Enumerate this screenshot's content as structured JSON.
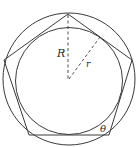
{
  "diagram": {
    "type": "geometry",
    "labels": {
      "circumradius": "R",
      "inradius": "r",
      "angle": "θ"
    },
    "colors": {
      "stroke": "#3a3a3a",
      "background": "#ffffff"
    },
    "geometry": {
      "center": [
        69,
        79
      ],
      "circumradius_px": 66,
      "inradius_px": 53,
      "polygon_sides": 5
    }
  }
}
